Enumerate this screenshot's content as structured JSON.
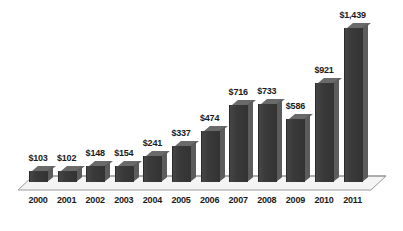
{
  "chart_data": {
    "type": "bar",
    "title": "",
    "subtitle": "",
    "xlabel": "",
    "ylabel": "",
    "categories": [
      "2000",
      "2001",
      "2002",
      "2003",
      "2004",
      "2005",
      "2006",
      "2007",
      "2008",
      "2009",
      "2010",
      "2011"
    ],
    "values": [
      103,
      102,
      148,
      154,
      241,
      337,
      474,
      716,
      733,
      586,
      921,
      1439
    ],
    "data_labels": [
      "$103",
      "$102",
      "$148",
      "$154",
      "$241",
      "$337",
      "$474",
      "$716",
      "$733",
      "$586",
      "$921",
      "$1,439"
    ],
    "ylim": [
      0,
      1439
    ],
    "grid": false,
    "legend": null,
    "axis_visible": {
      "x": true,
      "y": false
    },
    "style": {
      "bar_color": "#3a3a3a",
      "bar_side_color": "#5c5c5c",
      "bar_top_color": "#6a6a6a",
      "floor_color": "#f2f2f2",
      "floor_edge_color": "#8c8c8c",
      "label_color": "#1a1a1a",
      "background": "#ffffff",
      "three_d": true
    }
  }
}
